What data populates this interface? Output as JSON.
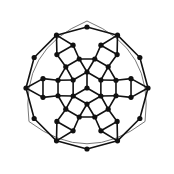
{
  "figure": {
    "title": "Concentric ring graph diagram",
    "background_color": "#ffffff",
    "width": 174,
    "height": 174,
    "center": [
      87,
      88
    ],
    "symmetry": "3-fold rotational",
    "node_color": "#111111",
    "edge_color": "#111111",
    "outer_arc_color": "#555555",
    "node_radius": 2.6,
    "edge_width": 1.6,
    "outer_arc_width": 0.8
  },
  "chart_data": {
    "type": "diagram",
    "title": "Concentric ring graph diagram",
    "node_count": 43,
    "rings": [
      {
        "name": "hub",
        "index": 0,
        "radius": 0,
        "node_count": 1,
        "angles_deg": [
          0
        ]
      },
      {
        "name": "inner-hexagon",
        "index": 1,
        "radius": 16,
        "node_count": 6,
        "angles_deg": [
          90,
          150,
          210,
          270,
          330,
          30
        ]
      },
      {
        "name": "ring-2",
        "index": 2,
        "radius": 30,
        "node_count": 12,
        "angles_deg": [
          75,
          105,
          135,
          165,
          195,
          225,
          255,
          285,
          315,
          345,
          15,
          45
        ]
      },
      {
        "name": "ring-3",
        "index": 3,
        "radius": 45,
        "node_count": 12,
        "angles_deg": [
          72,
          108,
          132,
          168,
          192,
          228,
          252,
          288,
          312,
          348,
          12,
          48
        ]
      },
      {
        "name": "ring-4",
        "index": 4,
        "radius": 61,
        "node_count": 12,
        "angles_deg": [
          90,
          120,
          150,
          180,
          210,
          240,
          270,
          300,
          330,
          0,
          30,
          60
        ]
      }
    ],
    "corner_nodes": {
      "description": "three peak nodes joined by thin outer arcs",
      "angles_deg": [
        90,
        210,
        330
      ],
      "radius": 61
    },
    "outer_boundary": {
      "shape": "rounded-triangle",
      "arc_count": 3,
      "style": "thin"
    },
    "hub_spokes_deg": [
      90,
      210,
      330
    ]
  }
}
